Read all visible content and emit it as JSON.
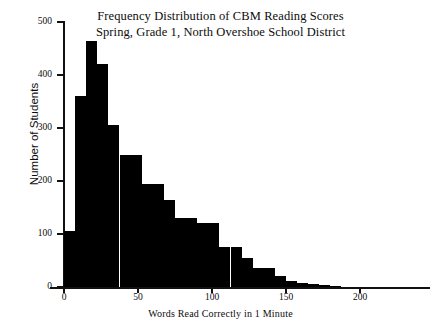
{
  "title": {
    "line1": "Frequency Distribution of CBM Reading Scores",
    "line2": "Spring, Grade 1, North Overshoe School District"
  },
  "axes": {
    "x_label": "Words Read Correctly in 1 Minute",
    "y_label": "Number of Students",
    "x_ticks": [
      "0",
      "50",
      "100",
      "150",
      "200"
    ],
    "y_ticks": [
      "0",
      "100",
      "200",
      "300",
      "400",
      "500"
    ]
  },
  "colors": {
    "bar_fill": "#000000",
    "axis": "#111111",
    "background": "#ffffff",
    "text": "#0c0c0c"
  },
  "chart_data": {
    "type": "bar",
    "xlabel": "Words Read Correctly in 1 Minute",
    "ylabel": "Number of Students",
    "xlim": [
      -7,
      222
    ],
    "ylim": [
      0,
      500
    ],
    "grid": false,
    "legend": "none",
    "bin_width": 7.5,
    "x_tick_values": [
      0,
      50,
      100,
      150,
      200
    ],
    "y_tick_values": [
      0,
      100,
      200,
      300,
      400,
      500
    ],
    "categories": [
      "0-7.5",
      "7.5-15",
      "15-22.5",
      "22.5-30",
      "30-37.5",
      "37.5-45",
      "45-52.5",
      "52.5-60",
      "60-67.5",
      "67.5-75",
      "75-82.5",
      "82.5-90",
      "90-97.5",
      "97.5-105",
      "105-112.5",
      "112.5-120",
      "120-127.5",
      "127.5-135",
      "135-142.5",
      "142.5-150",
      "150-157.5",
      "157.5-165",
      "165-172.5",
      "172.5-180",
      "180-187.5"
    ],
    "bin_starts": [
      0,
      7.5,
      15,
      22.5,
      30,
      37.5,
      45,
      52.5,
      60,
      67.5,
      75,
      82.5,
      90,
      97.5,
      105,
      112.5,
      120,
      127.5,
      135,
      142.5,
      150,
      157.5,
      165,
      172.5,
      180
    ],
    "values": [
      105,
      360,
      465,
      420,
      305,
      250,
      250,
      195,
      195,
      165,
      130,
      130,
      120,
      120,
      75,
      75,
      55,
      35,
      35,
      20,
      12,
      8,
      5,
      3,
      2
    ],
    "peak_value": 465,
    "peak_bin": "15-22.5"
  }
}
